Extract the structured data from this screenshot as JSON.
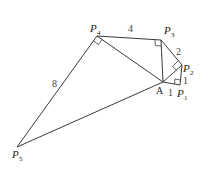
{
  "diagram": {
    "points": {
      "A": {
        "label": "A",
        "sub": ""
      },
      "P1": {
        "label": "P",
        "sub": "1"
      },
      "P2": {
        "label": "P",
        "sub": "2"
      },
      "P3": {
        "label": "P",
        "sub": "3"
      },
      "P4": {
        "label": "P",
        "sub": "4"
      },
      "P5": {
        "label": "P",
        "sub": "5"
      }
    },
    "segment_labels": {
      "A_P1": "1",
      "P1_P2": "1",
      "P2_P3": "2",
      "P3_P4": "4",
      "P4_P5": "8"
    },
    "right_angles": [
      "P1",
      "P2",
      "P3",
      "P4"
    ]
  }
}
